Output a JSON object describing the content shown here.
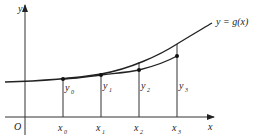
{
  "figure": {
    "axes": {
      "x_label": "x",
      "y_label": "y",
      "origin_label": "O"
    },
    "curve_label": "y = g(x)",
    "x_ticks": [
      {
        "base": "x",
        "sub": "0"
      },
      {
        "base": "x",
        "sub": "1"
      },
      {
        "base": "x",
        "sub": "2"
      },
      {
        "base": "x",
        "sub": "3"
      }
    ],
    "y_points": [
      {
        "base": "y",
        "sub": "0"
      },
      {
        "base": "y",
        "sub": "1"
      },
      {
        "base": "y",
        "sub": "2"
      },
      {
        "base": "y",
        "sub": "3"
      }
    ],
    "colors": {
      "line": "#222222",
      "axis": "#333333"
    }
  }
}
